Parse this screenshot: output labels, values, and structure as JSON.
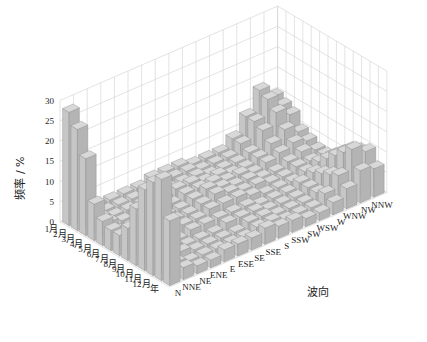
{
  "chart_data": {
    "type": "bar3d",
    "title": "",
    "ylabel": "频率 / %",
    "xlabel": "",
    "zlabel": "波向",
    "zlim": [
      0,
      30
    ],
    "z_ticks": [
      0,
      5,
      10,
      15,
      20,
      25,
      30
    ],
    "grid": true,
    "months": [
      "1月",
      "2月",
      "3月",
      "4月",
      "5月",
      "6月",
      "7月",
      "8月",
      "9月",
      "10月",
      "11月",
      "12月",
      "年"
    ],
    "directions": [
      "N",
      "NNE",
      "NE",
      "ENE",
      "E",
      "ESE",
      "SE",
      "SSE",
      "S",
      "SSW",
      "SW",
      "WSW",
      "W",
      "WNW",
      "NW",
      "NNW"
    ],
    "series": [
      {
        "name": "1月",
        "values": [
          28,
          3,
          2,
          2,
          2,
          2,
          3,
          3,
          3,
          2,
          2,
          2,
          4,
          8,
          13,
          10
        ]
      },
      {
        "name": "2月",
        "values": [
          25,
          3,
          2,
          2,
          2,
          2,
          3,
          3,
          3,
          2,
          2,
          2,
          4,
          8,
          12,
          9
        ]
      },
      {
        "name": "3月",
        "values": [
          19,
          3,
          2,
          2,
          2,
          3,
          3,
          3,
          3,
          2,
          2,
          2,
          3,
          7,
          10,
          8
        ]
      },
      {
        "name": "4月",
        "values": [
          9,
          3,
          2,
          2,
          3,
          3,
          4,
          4,
          3,
          3,
          2,
          2,
          3,
          5,
          7,
          5
        ]
      },
      {
        "name": "5月",
        "values": [
          6,
          2,
          2,
          2,
          3,
          3,
          4,
          4,
          4,
          3,
          3,
          2,
          3,
          4,
          5,
          4
        ]
      },
      {
        "name": "6月",
        "values": [
          5,
          2,
          2,
          2,
          3,
          3,
          4,
          5,
          4,
          3,
          3,
          2,
          2,
          3,
          4,
          3
        ]
      },
      {
        "name": "7月",
        "values": [
          5,
          2,
          2,
          2,
          3,
          3,
          4,
          5,
          4,
          3,
          3,
          2,
          2,
          3,
          3,
          3
        ]
      },
      {
        "name": "8月",
        "values": [
          8,
          3,
          2,
          2,
          3,
          3,
          4,
          4,
          4,
          3,
          2,
          2,
          2,
          3,
          4,
          4
        ]
      },
      {
        "name": "9月",
        "values": [
          14,
          4,
          3,
          2,
          3,
          3,
          3,
          3,
          3,
          2,
          2,
          2,
          3,
          4,
          6,
          6
        ]
      },
      {
        "name": "10月",
        "values": [
          20,
          5,
          3,
          2,
          2,
          2,
          3,
          3,
          3,
          2,
          2,
          2,
          3,
          5,
          8,
          8
        ]
      },
      {
        "name": "11月",
        "values": [
          23,
          4,
          3,
          2,
          2,
          2,
          2,
          3,
          3,
          2,
          2,
          2,
          3,
          6,
          10,
          9
        ]
      },
      {
        "name": "12月",
        "values": [
          25,
          3,
          2,
          2,
          2,
          2,
          2,
          3,
          3,
          2,
          2,
          2,
          4,
          7,
          12,
          10
        ]
      },
      {
        "name": "年",
        "values": [
          16,
          3,
          2,
          2,
          3,
          3,
          3,
          4,
          3,
          3,
          2,
          2,
          3,
          5,
          8,
          7
        ]
      }
    ]
  }
}
